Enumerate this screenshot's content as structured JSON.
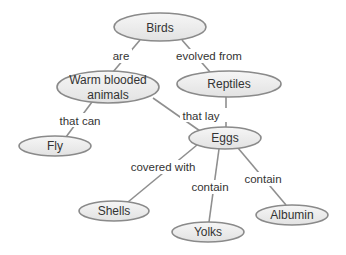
{
  "diagram": {
    "type": "concept-map",
    "colors": {
      "node_fill_top": "#f4f4f4",
      "node_fill_bottom": "#e4e4e4",
      "node_stroke": "#8a8a8a",
      "edge": "#8f8f8f",
      "text": "#333333"
    },
    "nodes": [
      {
        "id": "birds",
        "label": "Birds",
        "cx": 160,
        "cy": 27,
        "rx": 46,
        "ry": 14
      },
      {
        "id": "warm-blooded",
        "label_line1": "Warm blooded",
        "label_line2": "animals",
        "cx": 108,
        "cy": 87,
        "rx": 51,
        "ry": 16
      },
      {
        "id": "reptiles",
        "label": "Reptiles",
        "cx": 229,
        "cy": 84,
        "rx": 52,
        "ry": 13
      },
      {
        "id": "eggs",
        "label": "Eggs",
        "cx": 225,
        "cy": 138,
        "rx": 36,
        "ry": 11
      },
      {
        "id": "fly",
        "label": "Fly",
        "cx": 55,
        "cy": 146,
        "rx": 36,
        "ry": 10
      },
      {
        "id": "shells",
        "label": "Shells",
        "cx": 114,
        "cy": 211,
        "rx": 35,
        "ry": 10
      },
      {
        "id": "yolks",
        "label": "Yolks",
        "cx": 208,
        "cy": 232,
        "rx": 36,
        "ry": 10
      },
      {
        "id": "albumin",
        "label": "Albumin",
        "cx": 292,
        "cy": 215,
        "rx": 36,
        "ry": 10
      }
    ],
    "edges": [
      {
        "from": "birds",
        "to": "warm-blooded",
        "label": "are"
      },
      {
        "from": "birds",
        "to": "reptiles",
        "label": "evolved from"
      },
      {
        "from": "warm-blooded",
        "to": "fly",
        "label": "that can"
      },
      {
        "from": "warm-blooded",
        "to": "eggs",
        "label": "that lay"
      },
      {
        "from": "reptiles",
        "to": "eggs",
        "label": ""
      },
      {
        "from": "eggs",
        "to": "shells",
        "label": "covered with"
      },
      {
        "from": "eggs",
        "to": "yolks",
        "label": "contain"
      },
      {
        "from": "eggs",
        "to": "albumin",
        "label": "contain"
      }
    ]
  }
}
